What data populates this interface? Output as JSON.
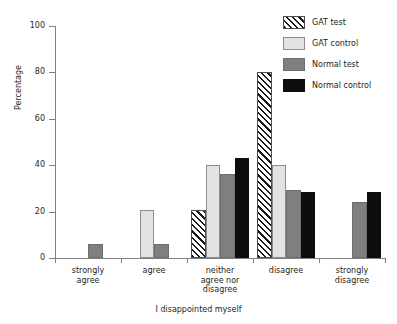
{
  "chart_data": {
    "type": "bar",
    "title": "",
    "xlabel": "I disappointed myself",
    "ylabel": "Percentage",
    "ylim": [
      0,
      100
    ],
    "yticks": [
      0,
      20,
      40,
      60,
      80,
      100
    ],
    "grid": false,
    "legend_position": "top-right",
    "categories": [
      "strongly\nagree",
      "agree",
      "neither\nagree nor\ndisagree",
      "disagree",
      "strongly\ndisagree"
    ],
    "category_lines": [
      [
        "strongly",
        "agree"
      ],
      [
        "agree"
      ],
      [
        "neither",
        "agree nor",
        "disagree"
      ],
      [
        "disagree"
      ],
      [
        "strongly",
        "disagree"
      ]
    ],
    "series": [
      {
        "name": "GAT test",
        "pattern": "diagonal-hatch",
        "color": "#ffffff",
        "values": [
          0,
          0,
          20.5,
          80,
          0
        ]
      },
      {
        "name": "GAT control",
        "pattern": "solid",
        "color": "#e3e3e3",
        "values": [
          0,
          20.5,
          40,
          40,
          0
        ]
      },
      {
        "name": "Normal test",
        "pattern": "solid",
        "color": "#7f7f7f",
        "values": [
          6,
          6,
          36,
          29.5,
          24
        ]
      },
      {
        "name": "Normal control",
        "pattern": "solid",
        "color": "#0d0d0d",
        "values": [
          0,
          0,
          43,
          28.5,
          28.5
        ]
      }
    ]
  },
  "legend": {
    "items": [
      {
        "label": "GAT test"
      },
      {
        "label": "GAT control"
      },
      {
        "label": "Normal test"
      },
      {
        "label": "Normal control"
      }
    ]
  },
  "axes": {
    "y_tick_labels": [
      "0",
      "20",
      "40",
      "60",
      "80",
      "100"
    ],
    "y_title": "Percentage",
    "x_title": "I disappointed myself"
  }
}
